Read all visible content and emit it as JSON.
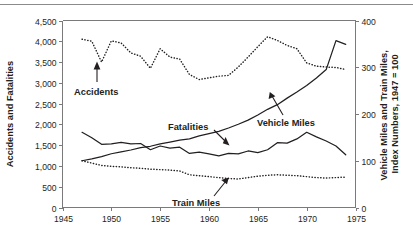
{
  "chart_data": {
    "type": "line",
    "title": "",
    "xlabel": "",
    "ylabel": "Accidents and Fatalities",
    "y2label": "Vehicle Miles and Train Miles, Index Numbers, 1947 = 100",
    "xlim": [
      1945,
      1975
    ],
    "ylim": [
      0,
      4500
    ],
    "y2lim": [
      0,
      400
    ],
    "xticks": [
      1945,
      1950,
      1955,
      1960,
      1965,
      1970,
      1975
    ],
    "xticklabels": [
      "1945",
      "1950",
      "1955",
      "1960",
      "1965",
      "1970",
      "1975"
    ],
    "yticks": [
      0,
      500,
      1000,
      1500,
      2000,
      2500,
      3000,
      3500,
      4000,
      4500
    ],
    "yticklabels": [
      "0",
      "500",
      "1,000",
      "1,500",
      "2,000",
      "2,500",
      "3,000",
      "3,500",
      "4,000",
      "4,500"
    ],
    "y2ticks": [
      0,
      100,
      200,
      300,
      400
    ],
    "y2ticklabels": [
      "0",
      "100",
      "200",
      "300",
      "400"
    ],
    "grid": false,
    "legend_position": "inline-annotations",
    "series": [
      {
        "name": "Accidents",
        "style": "dotted",
        "axis": "left",
        "label_text": "Accidents",
        "x": [
          1947,
          1948,
          1949,
          1950,
          1951,
          1952,
          1953,
          1954,
          1955,
          1956,
          1957,
          1958,
          1959,
          1960,
          1961,
          1962,
          1963,
          1964,
          1965,
          1966,
          1967,
          1968,
          1969,
          1970,
          1971,
          1972,
          1973,
          1974
        ],
        "values": [
          4050,
          4000,
          3500,
          4010,
          3960,
          3720,
          3640,
          3350,
          3820,
          3620,
          3570,
          3200,
          3080,
          3120,
          3160,
          3180,
          3380,
          3620,
          3870,
          4110,
          4020,
          3900,
          3820,
          3480,
          3400,
          3380,
          3370,
          3320
        ]
      },
      {
        "name": "Fatalities",
        "style": "solid",
        "axis": "left",
        "label_text": "Fatalities",
        "x": [
          1947,
          1948,
          1949,
          1950,
          1951,
          1952,
          1953,
          1954,
          1955,
          1956,
          1957,
          1958,
          1959,
          1960,
          1961,
          1962,
          1963,
          1964,
          1965,
          1966,
          1967,
          1968,
          1969,
          1970,
          1971,
          1972,
          1973,
          1974
        ],
        "values": [
          1810,
          1680,
          1520,
          1530,
          1570,
          1530,
          1540,
          1390,
          1480,
          1430,
          1450,
          1300,
          1330,
          1290,
          1240,
          1300,
          1290,
          1360,
          1320,
          1390,
          1560,
          1550,
          1650,
          1810,
          1700,
          1600,
          1480,
          1270
        ]
      },
      {
        "name": "Vehicle Miles",
        "style": "solid",
        "axis": "right",
        "label_text": "Vehicle Miles",
        "x": [
          1947,
          1948,
          1949,
          1950,
          1951,
          1952,
          1953,
          1954,
          1955,
          1956,
          1957,
          1958,
          1959,
          1960,
          1961,
          1962,
          1963,
          1964,
          1965,
          1966,
          1967,
          1968,
          1969,
          1970,
          1971,
          1972,
          1973,
          1974
        ],
        "values": [
          100,
          104,
          109,
          115,
          119,
          123,
          128,
          131,
          136,
          140,
          144,
          147,
          153,
          158,
          163,
          170,
          178,
          187,
          198,
          210,
          220,
          234,
          247,
          261,
          277,
          295,
          357,
          349
        ]
      },
      {
        "name": "Train Miles",
        "style": "dotted",
        "axis": "right",
        "label_text": "Train Miles",
        "x": [
          1947,
          1948,
          1949,
          1950,
          1951,
          1952,
          1953,
          1954,
          1955,
          1956,
          1957,
          1958,
          1959,
          1960,
          1961,
          1962,
          1963,
          1964,
          1965,
          1966,
          1967,
          1968,
          1969,
          1970,
          1971,
          1972,
          1973,
          1974
        ],
        "values": [
          100,
          95,
          90,
          88,
          87,
          85,
          84,
          82,
          81,
          80,
          78,
          70,
          68,
          66,
          64,
          62,
          61,
          64,
          67,
          69,
          70,
          69,
          68,
          66,
          64,
          63,
          64,
          65
        ]
      }
    ],
    "annotations": [
      {
        "text": "Accidents",
        "kind": "arrow-up"
      },
      {
        "text": "Fatalities",
        "kind": "arrow-down-right"
      },
      {
        "text": "Vehicle Miles",
        "kind": "leader-up-left"
      },
      {
        "text": "Train Miles",
        "kind": "arrow-up-right"
      }
    ]
  }
}
